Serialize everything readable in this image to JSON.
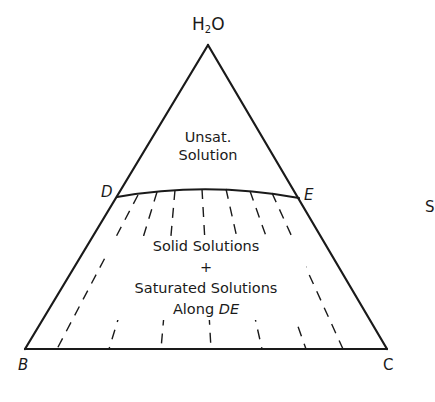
{
  "diagram": {
    "type": "ternary phase diagram (partial)",
    "vertices": {
      "top": {
        "main": "H",
        "sub": "2",
        "tail": "O"
      },
      "bottom_left": "B",
      "bottom_right": "C"
    },
    "curve_points": {
      "left": "D",
      "right": "E"
    },
    "regions": {
      "upper": {
        "line1": "Unsat.",
        "line2": "Solution"
      },
      "lower": {
        "line1": "Solid Solutions",
        "line2": "+",
        "line3": "Saturated Solutions",
        "line4_prefix": "Along ",
        "line4_italic": "DE"
      }
    },
    "edge_fragment": "S",
    "colors": {
      "line": "#1a1a1a",
      "background": "#ffffff"
    },
    "tie_lines": {
      "count": 7,
      "top_x": [
        138,
        157,
        175,
        202,
        226,
        250,
        272
      ],
      "bottom_x": [
        57,
        109,
        161,
        211,
        262,
        306,
        343
      ]
    }
  }
}
